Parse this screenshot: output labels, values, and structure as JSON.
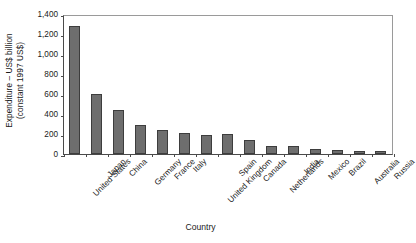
{
  "chart_data": {
    "type": "bar",
    "title": "",
    "xlabel": "Country",
    "ylabel": "Expenditure – US$ billion (constant 1997 US$)",
    "ylabel_lines": [
      "Expenditure – US$ billion",
      "(constant 1997 US$)"
    ],
    "categories": [
      "United States",
      "Japan",
      "China",
      "Germany",
      "France",
      "Italy",
      "United Kingdom",
      "Spain",
      "Canada",
      "Netherlands",
      "India",
      "Mexico",
      "Brazil",
      "Australia",
      "Russia"
    ],
    "values": [
      1280,
      600,
      440,
      290,
      240,
      215,
      195,
      200,
      140,
      80,
      85,
      55,
      45,
      32,
      30
    ],
    "ylim": [
      0,
      1400
    ],
    "yticks": [
      0,
      200,
      400,
      600,
      800,
      1000,
      1200,
      1400
    ],
    "ytick_labels": [
      "0",
      "200",
      "400",
      "600",
      "800",
      "1,000",
      "1,200",
      "1,400"
    ],
    "grid": false,
    "legend": false,
    "bar_color": "#6e6e6e",
    "bar_edge_color": "#3d3d3d",
    "axis_color": "#4a4a4a",
    "background_color": "#ffffff"
  }
}
